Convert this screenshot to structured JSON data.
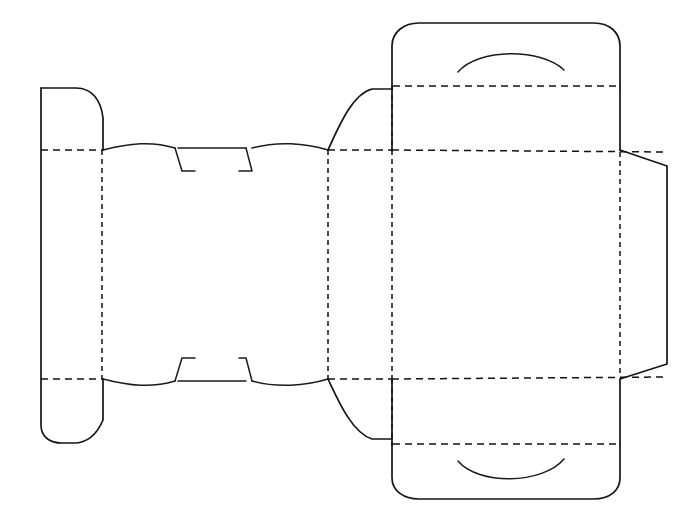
{
  "document": {
    "title": "Carton Dieline Template",
    "subject": "folding-carton-flat-layout",
    "background_color": "#ffffff",
    "line_color": "#151515",
    "canvas": {
      "width": 692,
      "height": 530
    }
  },
  "legend": {
    "cut_line_style": "solid",
    "crease_line_style": "dashed",
    "cut_color": "#151515",
    "crease_color": "#121212"
  },
  "geometry": {
    "creases": {
      "horizontal_main_top_y": 150,
      "horizontal_main_bottom_y": 379,
      "horizontal_lid_top_y": 86,
      "horizontal_lid_bottom_y": 444,
      "vertical_x_positions": [
        102,
        328,
        392,
        620
      ]
    },
    "cut_outline_extents": {
      "left_x": 40,
      "right_x": 668,
      "top_y": 22,
      "bottom_y": 500
    }
  },
  "panels": [
    {
      "id": "left-end-flap",
      "label": "Left End Flap",
      "x": 40,
      "y": 88,
      "width": 62,
      "height": 354,
      "shape": "rounded-tab"
    },
    {
      "id": "left-side-panel",
      "label": "Left Side Panel",
      "x": 102,
      "y": 150,
      "width": 226,
      "height": 229,
      "shape": "rectangle"
    },
    {
      "id": "front-panel",
      "label": "Front Panel",
      "x": 328,
      "y": 150,
      "width": 64,
      "height": 229,
      "shape": "narrow-rectangle"
    },
    {
      "id": "main-panel",
      "label": "Main Panel",
      "x": 392,
      "y": 150,
      "width": 228,
      "height": 229,
      "shape": "rectangle"
    },
    {
      "id": "right-glue-flap",
      "label": "Right Glue Flap",
      "x": 620,
      "y": 150,
      "width": 48,
      "height": 229,
      "shape": "trapezoid"
    },
    {
      "id": "top-lid-panel",
      "label": "Top Lid Panel",
      "x": 392,
      "y": 22,
      "width": 228,
      "height": 128,
      "shape": "rounded-rectangle"
    },
    {
      "id": "bottom-lid-panel",
      "label": "Bottom Lid Panel",
      "x": 392,
      "y": 379,
      "width": 228,
      "height": 121,
      "shape": "rounded-rectangle"
    },
    {
      "id": "top-tuck-flap-left",
      "label": "Top Tuck Flap",
      "x": 328,
      "y": 88,
      "width": 64,
      "height": 62,
      "shape": "curved-corner-flap"
    },
    {
      "id": "bottom-tuck-flap-left",
      "label": "Bottom Tuck Flap",
      "x": 328,
      "y": 379,
      "width": 64,
      "height": 62,
      "shape": "curved-corner-flap"
    },
    {
      "id": "top-dust-flap",
      "label": "Top Dust Flap",
      "x": 102,
      "y": 120,
      "width": 226,
      "height": 30,
      "shape": "curved-flap-with-lock"
    },
    {
      "id": "bottom-dust-flap",
      "label": "Bottom Dust Flap",
      "x": 102,
      "y": 379,
      "width": 226,
      "height": 30,
      "shape": "curved-flap-with-lock"
    }
  ],
  "features": [
    {
      "id": "top-thumb-notch",
      "label": "Top Thumb Notch Arc",
      "type": "arc",
      "center_x": 510,
      "center_y": 62,
      "span": 210,
      "orientation": "convex-up"
    },
    {
      "id": "bottom-thumb-notch",
      "label": "Bottom Thumb Notch Arc",
      "type": "arc",
      "center_x": 510,
      "center_y": 468,
      "span": 210,
      "orientation": "concave-up"
    },
    {
      "id": "top-lock-tab",
      "label": "Top Interlocking Lock Tab",
      "type": "lock-tab",
      "x": 175,
      "y": 148,
      "width": 75,
      "height": 28
    },
    {
      "id": "bottom-lock-tab",
      "label": "Bottom Interlocking Lock Tab",
      "type": "lock-tab",
      "x": 175,
      "y": 355,
      "width": 75,
      "height": 28
    }
  ]
}
